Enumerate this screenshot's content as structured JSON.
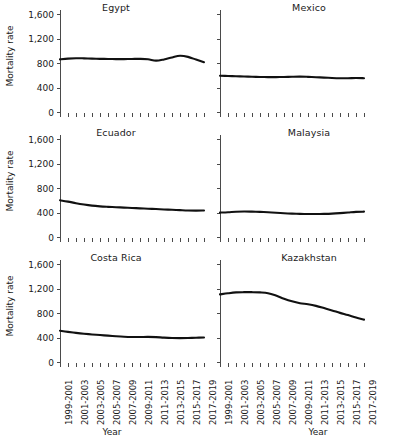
{
  "figure": {
    "ylabel": "Mortality rate",
    "xlabel": "Year",
    "yticks": [
      "0",
      "400",
      "800",
      "1,200",
      "1,600"
    ]
  },
  "chart_data": {
    "type": "line",
    "title": "",
    "xlabel": "Year",
    "ylabel": "Mortality rate",
    "ylim": [
      0,
      1600
    ],
    "yticks": [
      0,
      400,
      800,
      1200,
      1600
    ],
    "grid": false,
    "legend": "none",
    "layout": "small-multiples 3 rows x 2 columns",
    "categories": [
      "1999-2001",
      "2000-2002",
      "2001-2003",
      "2002-2004",
      "2003-2005",
      "2004-2006",
      "2005-2007",
      "2006-2008",
      "2007-2009",
      "2008-2010",
      "2009-2011",
      "2010-2012",
      "2011-2013",
      "2012-2014",
      "2013-2015",
      "2014-2016",
      "2015-2017",
      "2016-2018",
      "2017-2019"
    ],
    "tick_labels_shown": [
      "1999-2001",
      "2001-2003",
      "2003-2005",
      "2005-2007",
      "2007-2009",
      "2009-2011",
      "2011-2013",
      "2013-2015",
      "2015-2017",
      "2017-2019"
    ],
    "series": [
      {
        "name": "Egypt",
        "values": [
          860,
          872,
          878,
          876,
          872,
          868,
          866,
          864,
          864,
          866,
          868,
          862,
          838,
          858,
          890,
          918,
          900,
          856,
          812
        ]
      },
      {
        "name": "Mexico",
        "values": [
          592,
          588,
          584,
          580,
          576,
          572,
          570,
          570,
          572,
          576,
          578,
          574,
          568,
          562,
          556,
          552,
          552,
          554,
          552
        ]
      },
      {
        "name": "Ecuador",
        "values": [
          600,
          578,
          552,
          530,
          512,
          500,
          492,
          486,
          480,
          474,
          468,
          462,
          456,
          450,
          444,
          438,
          432,
          430,
          432
        ]
      },
      {
        "name": "Malaysia",
        "values": [
          398,
          404,
          412,
          416,
          414,
          410,
          404,
          396,
          388,
          382,
          378,
          376,
          376,
          378,
          382,
          390,
          400,
          410,
          414
        ]
      },
      {
        "name": "Costa Rica",
        "values": [
          510,
          492,
          476,
          462,
          450,
          440,
          430,
          420,
          412,
          408,
          408,
          410,
          406,
          398,
          392,
          390,
          392,
          396,
          400
        ]
      },
      {
        "name": "Kazakhstan",
        "values": [
          1104,
          1122,
          1136,
          1140,
          1140,
          1136,
          1124,
          1084,
          1032,
          990,
          960,
          942,
          916,
          880,
          842,
          802,
          766,
          726,
          692
        ]
      }
    ]
  },
  "panels": [
    {
      "title": "Egypt",
      "series_index": 0,
      "column": "left"
    },
    {
      "title": "Mexico",
      "series_index": 1,
      "column": "right"
    },
    {
      "title": "Ecuador",
      "series_index": 2,
      "column": "left"
    },
    {
      "title": "Malaysia",
      "series_index": 3,
      "column": "right"
    },
    {
      "title": "Costa Rica",
      "series_index": 4,
      "column": "left"
    },
    {
      "title": "Kazakhstan",
      "series_index": 5,
      "column": "right"
    }
  ]
}
